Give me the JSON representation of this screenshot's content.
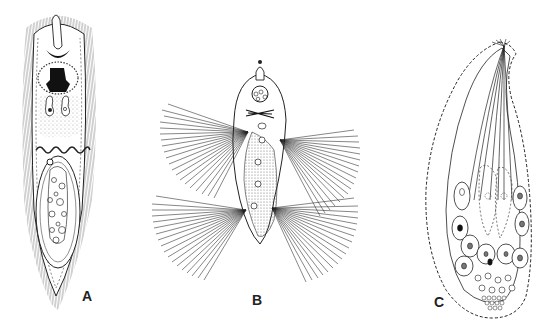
{
  "figure": {
    "background": "#ffffff",
    "ink_color": "#1a1a1a",
    "panels": [
      {
        "id": "A",
        "label": "A",
        "description": "elongated ciliated organism with dense lateral cilia, anterior apical structure, dark central mass, paired vesicles, wavy band and posterior oval chamber with spherical bodies"
      },
      {
        "id": "B",
        "label": "B",
        "description": "organism with rounded anterior head bearing small apical knob and vacuole cluster, crossed rods, stippled central body and four large fan-shaped ciliary tufts"
      },
      {
        "id": "C",
        "label": "C",
        "description": "curved flask-shaped organism with beaded outer membrane, bundle of fibres converging to apex, nucleated cells and clustered posterior granules"
      }
    ]
  }
}
